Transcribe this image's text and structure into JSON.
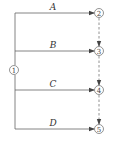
{
  "diagram": {
    "type": "activity-on-arrow network",
    "start_node": {
      "label": "1"
    },
    "nodes": [
      {
        "label": "2"
      },
      {
        "label": "3"
      },
      {
        "label": "4"
      },
      {
        "label": "5"
      }
    ],
    "activities": [
      {
        "label": "A",
        "from": "1",
        "to": "2"
      },
      {
        "label": "B",
        "from": "1",
        "to": "3"
      },
      {
        "label": "C",
        "from": "1",
        "to": "4"
      },
      {
        "label": "D",
        "from": "1",
        "to": "5"
      }
    ],
    "dummy_activities": [
      {
        "from": "2",
        "to": "3"
      },
      {
        "from": "3",
        "to": "4"
      },
      {
        "from": "4",
        "to": "5"
      }
    ]
  }
}
